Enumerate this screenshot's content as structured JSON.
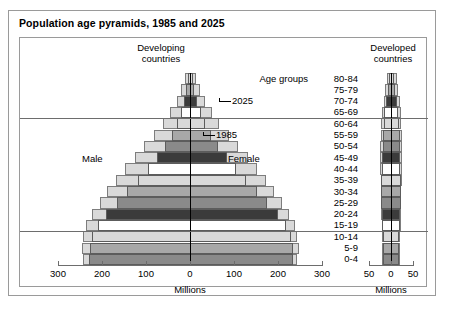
{
  "title": "Population age pyramids, 1985 and 2025",
  "panels": {
    "left": {
      "heading_line1": "Developing",
      "heading_line2": "countries",
      "axis_caption": "Millions",
      "ticks": [
        "300",
        "200",
        "100",
        "0",
        "100",
        "200",
        "300"
      ],
      "male_label": "Male",
      "female_label": "Female",
      "callout_2025": "2025",
      "callout_1985": "1985"
    },
    "right": {
      "heading_line1": "Developed",
      "heading_line2": "countries",
      "axis_caption": "Millions",
      "ticks": [
        "50",
        "0",
        "50"
      ]
    }
  },
  "age_axis": {
    "title": "Age groups",
    "groups": [
      "80-84",
      "75-79",
      "70-74",
      "65-69",
      "60-64",
      "55-59",
      "50-54",
      "45-49",
      "40-44",
      "35-39",
      "30-34",
      "25-29",
      "20-24",
      "15-19",
      "10-14",
      "5-9",
      "0-4"
    ]
  },
  "chart_data": {
    "type": "bar",
    "title": "Population age pyramids, 1985 and 2025",
    "subtype": "population-pyramid",
    "categories": [
      "80-84",
      "75-79",
      "70-74",
      "65-69",
      "60-64",
      "55-59",
      "50-54",
      "45-49",
      "40-44",
      "35-39",
      "30-34",
      "25-29",
      "20-24",
      "15-19",
      "10-14",
      "5-9",
      "0-4"
    ],
    "xlabel": "Millions",
    "ylabel": "Age groups",
    "grid": false,
    "reference_lines_between": [
      "65-69|60-64",
      "15-19|10-14"
    ],
    "panels": [
      {
        "name": "Developing countries",
        "xlim": [
          -300,
          300
        ],
        "xticks": [
          -300,
          -200,
          -100,
          0,
          100,
          200,
          300
        ],
        "series": [
          {
            "name": "2025 male",
            "values": [
              -12,
              -20,
              -30,
              -45,
              -62,
              -82,
              -104,
              -126,
              -148,
              -168,
              -188,
              -205,
              -222,
              -236,
              -243,
              -246,
              -243
            ]
          },
          {
            "name": "2025 female",
            "values": [
              14,
              23,
              34,
              50,
              67,
              88,
              110,
              132,
              153,
              173,
              192,
              209,
              225,
              238,
              244,
              247,
              243
            ]
          },
          {
            "name": "1985 male",
            "values": [
              -5,
              -8,
              -13,
              -20,
              -30,
              -42,
              -57,
              -75,
              -96,
              -119,
              -143,
              -167,
              -190,
              -210,
              -222,
              -228,
              -230
            ]
          },
          {
            "name": "1985 female",
            "values": [
              6,
              10,
              16,
              24,
              35,
              48,
              64,
              83,
              105,
              128,
              152,
              176,
              199,
              218,
              229,
              234,
              235
            ]
          }
        ]
      },
      {
        "name": "Developed countries",
        "xlim": [
          -50,
          50
        ],
        "xticks": [
          -50,
          0,
          50
        ],
        "series": [
          {
            "name": "2025 male",
            "values": [
              -10,
              -14,
              -17,
              -20,
              -22,
              -23,
              -24,
              -24,
              -24,
              -23,
              -23,
              -22,
              -22,
              -21,
              -21,
              -20,
              -20
            ]
          },
          {
            "name": "2025 female",
            "values": [
              13,
              17,
              20,
              22,
              23,
              24,
              24,
              24,
              24,
              24,
              23,
              23,
              22,
              22,
              21,
              21,
              20
            ]
          },
          {
            "name": "1985 male",
            "values": [
              -4,
              -7,
              -11,
              -15,
              -17,
              -18,
              -19,
              -20,
              -21,
              -22,
              -22,
              -22,
              -21,
              -20,
              -19,
              -18,
              -18
            ]
          },
          {
            "name": "1985 female",
            "values": [
              6,
              10,
              14,
              17,
              19,
              20,
              20,
              21,
              21,
              22,
              22,
              22,
              21,
              20,
              19,
              18,
              18
            ]
          }
        ]
      }
    ]
  },
  "colors": {
    "band_light": "#d9d9d9",
    "band_mid": "#a8a8a8",
    "band_dark": "#8a8a8a",
    "band_darkest": "#3b3b3b",
    "band_white": "#ffffff",
    "outline": "#5c5c5c",
    "frame": "#9a9a9a"
  }
}
